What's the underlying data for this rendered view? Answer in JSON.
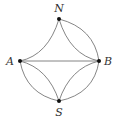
{
  "diagram": {
    "type": "graph",
    "nodes": [
      {
        "id": "N",
        "label": "N",
        "x": 59,
        "y": 19,
        "lx": 59,
        "ly": 12
      },
      {
        "id": "A",
        "label": "A",
        "x": 20,
        "y": 61,
        "lx": 10,
        "ly": 65
      },
      {
        "id": "B",
        "label": "B",
        "x": 99,
        "y": 61,
        "lx": 108,
        "ly": 65
      },
      {
        "id": "S",
        "label": "S",
        "x": 59,
        "y": 101,
        "lx": 59,
        "ly": 116
      }
    ],
    "edges": [
      {
        "from": "N",
        "to": "A",
        "kind": "curve-in"
      },
      {
        "from": "N",
        "to": "B",
        "kind": "curve-in"
      },
      {
        "from": "N",
        "to": "B",
        "kind": "curve-out"
      },
      {
        "from": "A",
        "to": "B",
        "kind": "straight"
      },
      {
        "from": "A",
        "to": "S",
        "kind": "curve-in"
      },
      {
        "from": "A",
        "to": "S",
        "kind": "curve-out"
      },
      {
        "from": "S",
        "to": "B",
        "kind": "curve-in"
      },
      {
        "from": "S",
        "to": "B",
        "kind": "curve-out"
      }
    ],
    "colors": {
      "edge": "#777777",
      "node": "#111111",
      "label": "#333333"
    }
  }
}
